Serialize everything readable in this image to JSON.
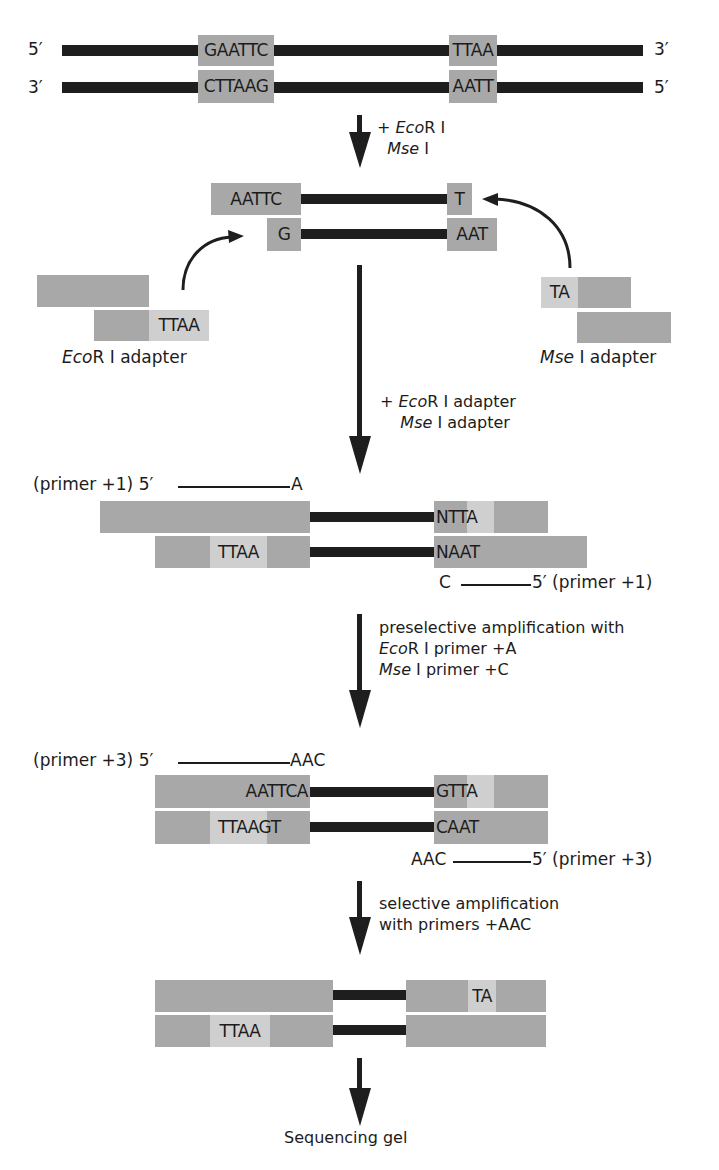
{
  "diagram": {
    "stage1": {
      "top_strand": {
        "five_label": "5′",
        "three_label": "3′",
        "ecori_site": "GAATTC",
        "msei_site": "TTAA"
      },
      "bottom_strand": {
        "three_label": "3′",
        "five_label": "5′",
        "ecori_site": "CTTAAG",
        "msei_site": "AATT"
      }
    },
    "step1": {
      "plus": "+ ",
      "enzyme1_italic": "Eco",
      "enzyme1_rest": "R I",
      "enzyme2_italic": "Mse",
      "enzyme2_rest": " I"
    },
    "stage2": {
      "top_left_overhang": "AATTC",
      "top_right": "T",
      "bottom_left": "G",
      "bottom_right_overhang": "AAT",
      "ecori_adapter": {
        "sticky_end": "TTAA",
        "label_italic": "Eco",
        "label_rest": "R I adapter"
      },
      "msei_adapter": {
        "sticky_end": "TA",
        "label_italic": "Mse",
        "label_rest": " I adapter"
      }
    },
    "step2": {
      "plus": "+ ",
      "line1_italic": "Eco",
      "line1_rest": "R I adapter",
      "line2_italic": "Mse",
      "line2_rest": " I adapter"
    },
    "stage3": {
      "top_primer": {
        "label": "(primer +1) 5′",
        "end": "A"
      },
      "top_right_seq": "NTTA",
      "bottom_left_seq": "TTAA",
      "bottom_right_seq": "NAAT",
      "bottom_primer": {
        "start": "C",
        "label": "5′ (primer +1)"
      }
    },
    "step3": {
      "line1": "preselective amplification with",
      "line2_italic": "Eco",
      "line2_rest": "R I primer +A",
      "line3_italic": "Mse",
      "line3_rest": " I primer +C"
    },
    "stage4": {
      "top_primer": {
        "label": "(primer +3) 5′",
        "end": "AAC"
      },
      "top_left_seq": "AATTCA",
      "top_right_seq": "GTTA",
      "bottom_left_seq": "TTAAGT",
      "bottom_right_seq": "CAAT",
      "bottom_primer": {
        "start": "AAC",
        "label": "5′ (primer +3)"
      }
    },
    "step4": {
      "line1": "selective amplification",
      "line2": "with primers +AAC"
    },
    "stage5": {
      "top_right_seq": "TA",
      "bottom_left_seq": "TTAA"
    },
    "final_label": "Sequencing gel",
    "colors": {
      "strand": "#1e1e1e",
      "adapter_dark": "#a8a8a8",
      "adapter_light": "#cfcfcf",
      "background": "#ffffff"
    }
  }
}
